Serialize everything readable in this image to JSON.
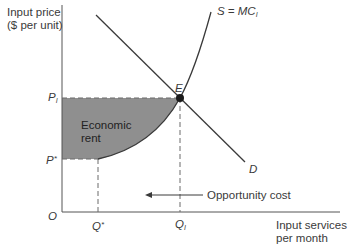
{
  "diagram": {
    "type": "economic-rent-graph",
    "y_axis_label_line1": "Input price",
    "y_axis_label_line2": "($ per unit)",
    "x_axis_label_line1": "Input services",
    "x_axis_label_line2": "per month",
    "origin_label": "O",
    "price_levels": {
      "p_i": "P",
      "p_i_sub": "I",
      "p_star": "P",
      "p_star_sup": "*"
    },
    "quantity_levels": {
      "q_star": "Q",
      "q_star_sup": "*",
      "q_i": "Q",
      "q_i_sub": "I"
    },
    "curves": {
      "supply_label": "S = MC",
      "supply_sub": "I",
      "demand_label": "D"
    },
    "equilibrium_label": "E",
    "shaded_region_line1": "Economic",
    "shaded_region_line2": "rent",
    "annotation": "Opportunity cost",
    "colors": {
      "shading": "#8f8f8f",
      "lines": "#3a3a3a",
      "dashes": "#6a6a6a"
    }
  }
}
